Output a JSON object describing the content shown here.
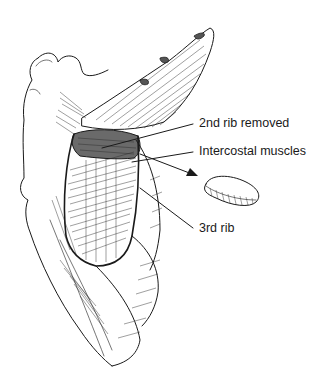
{
  "figure": {
    "colors": {
      "ink": "#1a1a1a",
      "background": "#ffffff",
      "shadow": "#555555"
    }
  },
  "labels": [
    {
      "id": "second-rib-removed",
      "text": "2nd rib removed",
      "x": 199,
      "y": 117,
      "leader": {
        "from": [
          193,
          124
        ],
        "to": [
          102,
          148
        ]
      }
    },
    {
      "id": "intercostal-muscles",
      "text": "Intercostal muscles",
      "x": 199,
      "y": 145,
      "leader": {
        "from": [
          193,
          152
        ],
        "to": [
          132,
          162
        ]
      }
    },
    {
      "id": "third-rib",
      "text": "3rd rib",
      "x": 199,
      "y": 222,
      "leader": {
        "from": [
          193,
          228
        ],
        "to": [
          140,
          188
        ]
      }
    }
  ],
  "excised_rib_arrow": {
    "from": [
      140,
      154
    ],
    "to": [
      196,
      175
    ]
  }
}
